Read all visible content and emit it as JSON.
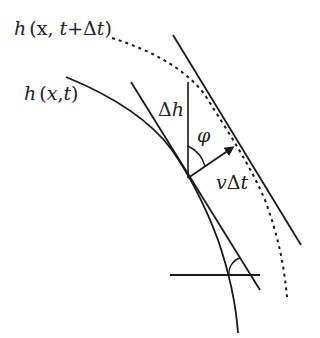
{
  "diagram": {
    "labels": {
      "future_front": "h(x, t+Δt)",
      "future_front_parts": {
        "h": "h",
        "open": "(",
        "x": "x",
        "comma": ", ",
        "t": "t",
        "plus": "+Δ",
        "t2": "t",
        "close": ")"
      },
      "current_front": "h(x,t)",
      "current_front_parts": {
        "h": "h",
        "open": "(",
        "x": "x",
        "comma": ",",
        "t": "t",
        "close": ")"
      },
      "height_change": "Δh",
      "height_change_parts": {
        "delta": "Δ",
        "h": "h"
      },
      "angle": "φ",
      "displacement": "vΔt",
      "displacement_parts": {
        "v": "v",
        "delta": "Δ",
        "t": "t"
      }
    },
    "elements": [
      "current interface curve h(x,t) (solid)",
      "future interface curve h(x,t+Δt) (dashed)",
      "tangent line to current curve",
      "parallel tangent line to future curve",
      "vertical segment Δh",
      "normal velocity arrow vΔt",
      "angle φ between Δh and arrow",
      "horizontal reference line with slope angle arc"
    ],
    "colors": {
      "stroke": "#1a1a1a",
      "text": "#222222",
      "background": "#ffffff"
    }
  }
}
